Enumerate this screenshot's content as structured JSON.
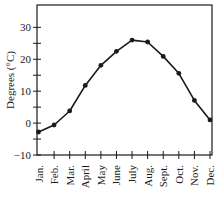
{
  "chart_data": {
    "type": "line",
    "title": "",
    "xlabel": "",
    "ylabel": "Degrees (°C)",
    "ylim": [
      -10,
      37
    ],
    "yticks_labeled": [
      -10,
      0,
      10,
      20,
      30
    ],
    "yticks_minor": [
      -5,
      5,
      15,
      25
    ],
    "grid": false,
    "legend": null,
    "categories": [
      "Jan.",
      "Feb.",
      "Mar.",
      "April",
      "May",
      "June",
      "July",
      "Aug.",
      "Sept.",
      "Oct.",
      "Nov.",
      "Dec."
    ],
    "series": [
      {
        "name": "Average temperature",
        "values": [
          -2.8,
          -0.6,
          3.8,
          11.8,
          18.1,
          22.5,
          26.0,
          25.4,
          20.9,
          15.6,
          7.1,
          1.0
        ]
      }
    ],
    "colors": {
      "line": "#1a1a1a",
      "axis": "#1a1a1a"
    }
  }
}
